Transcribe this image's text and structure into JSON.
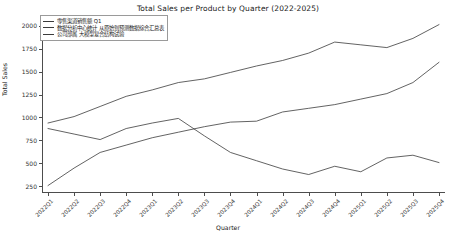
{
  "chart_data": {
    "type": "line",
    "title": "Total Sales per Product by Quarter (2022-2025)",
    "xlabel": "Quarter",
    "ylabel": "Total Sales",
    "grid": false,
    "legend_position": "upper left",
    "categories": [
      "2022Q1",
      "2022Q2",
      "2022Q3",
      "2022Q4",
      "2023Q1",
      "2023Q2",
      "2023Q3",
      "2023Q4",
      "2024Q1",
      "2024Q2",
      "2024Q3",
      "2024Q4",
      "2025Q1",
      "2025Q2",
      "2025Q3",
      "2025Q4"
    ],
    "x_tick_labels": [
      "2022Q1",
      "2022Q2",
      "2022Q3",
      "2022Q4",
      "2023Q1",
      "2023Q2",
      "2023Q3",
      "2023Q4",
      "2024Q1",
      "2024Q2",
      "2024Q3",
      "2024Q4",
      "2025Q1",
      "2025Q2",
      "2025Q3",
      "2025Q4"
    ],
    "y_tick_labels": [
      "2000",
      "1750",
      "1500",
      "1250",
      "1000",
      "750",
      "500",
      "250"
    ],
    "y_ticks": [
      2000,
      1750,
      1500,
      1250,
      1000,
      750,
      500,
      250
    ],
    "ylim": [
      190,
      2060
    ],
    "series": [
      {
        "name": "零售渠道销售额 Q1",
        "color": "#3b3b3b",
        "values": [
          940,
          1010,
          1120,
          1230,
          1300,
          1380,
          1420,
          1490,
          1560,
          1620,
          1700,
          1820,
          1790,
          1760,
          1860,
          2010
        ]
      },
      {
        "name": "数据分析中心统计  从原始到预测数据综合汇总表",
        "color": "#3b3b3b",
        "values": [
          880,
          820,
          760,
          880,
          940,
          990,
          800,
          620,
          530,
          440,
          380,
          470,
          410,
          560,
          590,
          510
        ]
      },
      {
        "name": "公司部属 大模型复合结构试验",
        "color": "#3b3b3b",
        "values": [
          260,
          450,
          620,
          700,
          780,
          840,
          900,
          950,
          960,
          1060,
          1100,
          1140,
          1200,
          1260,
          1380,
          1600
        ]
      }
    ],
    "legend_entries": [
      "零售渠道销售额 Q1",
      "数据分析中心统计  从原始到预测数据综合汇总表",
      "公司部属 大模型复合结构试验"
    ]
  }
}
